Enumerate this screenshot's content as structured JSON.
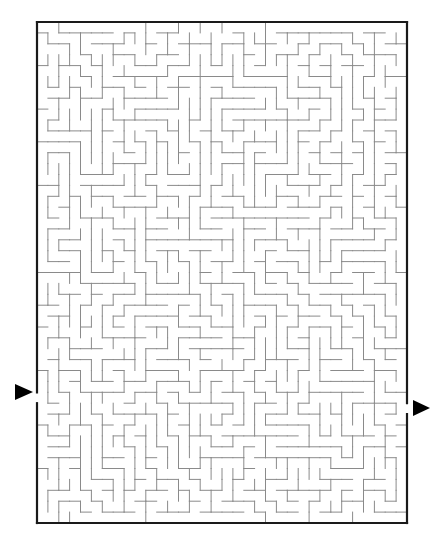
{
  "puzzle": {
    "type": "maze",
    "colors": {
      "background": "#ffffff",
      "border": "#1a1a1a",
      "walls": "#8a8a8a",
      "arrows": "#000000"
    },
    "bounds": {
      "left": 37,
      "top": 22,
      "right": 407,
      "bottom": 523
    },
    "grid": {
      "cols": 34,
      "rows": 46
    },
    "entrance": {
      "side": "left",
      "row": 34,
      "arrow_icon": "arrow-right-icon",
      "arrow_center": [
        24,
        392
      ]
    },
    "exit": {
      "side": "right",
      "row": 35,
      "arrow_icon": "arrow-right-icon",
      "arrow_center": [
        421,
        408
      ]
    },
    "seed": 7919
  }
}
